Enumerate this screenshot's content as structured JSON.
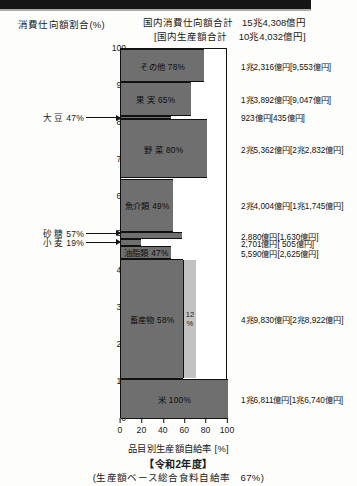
{
  "header": {
    "y_axis_title": "消費仕向額割合(%)",
    "total_consumption_label": "国内消費仕向額合計",
    "total_consumption_value": "15兆4,308億円",
    "total_production_label": "[国内生産額合計",
    "total_production_value": "10兆4,032億円]"
  },
  "footer": {
    "x_axis_label": "品目別生産額自給率 [%]",
    "fiscal_year": "【令和2年度】",
    "overall_rate": "(生産額ベース総合食料自給率　67%)"
  },
  "axes": {
    "y_ticks": [
      "100",
      "90",
      "80",
      "70",
      "60",
      "50",
      "40",
      "30",
      "20",
      "10",
      "0"
    ],
    "x_ticks": [
      "0",
      "20",
      "40",
      "60",
      "80",
      "100"
    ],
    "y_min": 0,
    "y_max": 100,
    "x_min": 0,
    "x_max": 100
  },
  "chart_data": {
    "type": "bar",
    "orientation": "horizontal-stacked-marimekko",
    "xlabel": "品目別生産額自給率 [%]",
    "ylabel": "消費仕向額割合(%)",
    "xlim": [
      0,
      100
    ],
    "ylim": [
      0,
      100
    ],
    "grid": false,
    "legend": "none",
    "categories": [
      "米",
      "畜産物",
      "油脂類",
      "小麦",
      "砂糖",
      "魚介類",
      "野菜",
      "大豆",
      "果実",
      "その他"
    ],
    "series": [
      {
        "name": "米",
        "self_sufficiency_pct": 100,
        "label": "米 100%",
        "share_start_pct": 0,
        "share_end_pct": 10.9,
        "consumption": "1兆6,811億円",
        "production": "[1兆6,740億円]",
        "value_note": "1兆6,811億円[1兆6,740億円]",
        "sub_segment": null
      },
      {
        "name": "畜産物",
        "self_sufficiency_pct": 58,
        "label": "畜産物 58%",
        "share_start_pct": 10.9,
        "share_end_pct": 43.2,
        "consumption": "4兆9,830億円",
        "production": "[2兆8,922億円]",
        "value_note": "4兆9,830億円[2兆8,922億円]",
        "sub_segment": {
          "label": "12\n%",
          "pct_width": 12,
          "value": 12
        }
      },
      {
        "name": "油脂類",
        "self_sufficiency_pct": 47,
        "label": "油脂類 47%",
        "share_start_pct": 43.2,
        "share_end_pct": 46.8,
        "consumption": "5,590億円",
        "production": "[2,625億円]",
        "value_note": "5,590億円[2,625億円]",
        "sub_segment": null
      },
      {
        "name": "小麦",
        "self_sufficiency_pct": 19,
        "label": "小 麦 19%",
        "share_start_pct": 46.8,
        "share_end_pct": 48.6,
        "consumption": "2,701億円",
        "production": "[ 505億円]",
        "value_note": "2,701億円[  505億円]",
        "sub_segment": null
      },
      {
        "name": "砂糖",
        "self_sufficiency_pct": 57,
        "label": "砂 糖 57%",
        "share_start_pct": 48.6,
        "share_end_pct": 50.5,
        "consumption": "2,880億円",
        "production": "[1,630億円]",
        "value_note": "2,880億円[1,630億円]",
        "sub_segment": null
      },
      {
        "name": "魚介類",
        "self_sufficiency_pct": 49,
        "label": "魚介類 49%",
        "share_start_pct": 50.5,
        "share_end_pct": 65.0,
        "consumption": "2兆4,004億円",
        "production": "[1兆1,745億円]",
        "value_note": "2兆4,004億円[1兆1,745億円]",
        "sub_segment": null
      },
      {
        "name": "野菜",
        "self_sufficiency_pct": 80,
        "label": "野 菜 80%",
        "share_start_pct": 65.0,
        "share_end_pct": 81.0,
        "consumption": "2兆5,362億円",
        "production": "[2兆2,832億円]",
        "value_note": "2兆5,362億円[2兆2,832億円]",
        "sub_segment": null
      },
      {
        "name": "大豆",
        "self_sufficiency_pct": 47,
        "label": "大 豆 47%",
        "share_start_pct": 81.0,
        "share_end_pct": 82.0,
        "consumption": "923億円",
        "production": "[435億円]",
        "value_note": "923億円[435億円]",
        "sub_segment": null
      },
      {
        "name": "果実",
        "self_sufficiency_pct": 65,
        "label": "果 実 65%",
        "share_start_pct": 82.0,
        "share_end_pct": 91.0,
        "consumption": "1兆3,892億円",
        "production": "[9,047億円]",
        "value_note": "1兆3,892億円[9,047億円]",
        "sub_segment": null
      },
      {
        "name": "その他",
        "self_sufficiency_pct": 78,
        "label": "その他 78%",
        "share_start_pct": 91.0,
        "share_end_pct": 100.0,
        "consumption": "1兆2,316億円",
        "production": "[9,553億円]",
        "value_note": "1兆2,316億円[9,553億円]",
        "sub_segment": null
      }
    ],
    "callouts": [
      {
        "name": "大豆",
        "text": "大 豆 47%",
        "y_pct": 81.3
      },
      {
        "name": "砂糖",
        "text": "砂 糖 57%",
        "y_pct": 50.0
      },
      {
        "name": "小麦",
        "text": "小 麦 19%",
        "y_pct": 47.6
      }
    ]
  },
  "colors": {
    "bar_fill": "#6f6f6f",
    "sub_fill": "#c2c2c2",
    "remainder": "#ffffff",
    "outline": "#111111",
    "page_bg": "#fdfdfb"
  }
}
